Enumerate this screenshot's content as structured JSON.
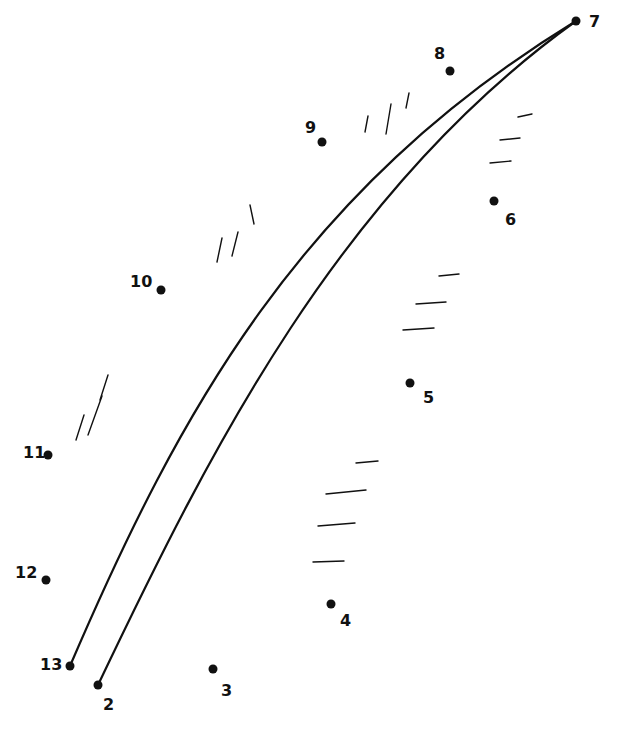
{
  "worksheet": {
    "type": "connect-the-dots",
    "subject": "feather",
    "colors": {
      "ink": "#111111",
      "background": "#ffffff"
    },
    "dots": [
      {
        "n": "2",
        "x": 98,
        "y": 685,
        "lx": 103,
        "ly": 710
      },
      {
        "n": "3",
        "x": 213,
        "y": 669,
        "lx": 221,
        "ly": 696
      },
      {
        "n": "4",
        "x": 331,
        "y": 604,
        "lx": 340,
        "ly": 626
      },
      {
        "n": "5",
        "x": 410,
        "y": 383,
        "lx": 423,
        "ly": 403
      },
      {
        "n": "6",
        "x": 494,
        "y": 201,
        "lx": 505,
        "ly": 225
      },
      {
        "n": "7",
        "x": 576,
        "y": 21,
        "lx": 589,
        "ly": 27
      },
      {
        "n": "8",
        "x": 450,
        "y": 71,
        "lx": 434,
        "ly": 59
      },
      {
        "n": "9",
        "x": 322,
        "y": 142,
        "lx": 305,
        "ly": 133
      },
      {
        "n": "10",
        "x": 161,
        "y": 290,
        "lx": 130,
        "ly": 287
      },
      {
        "n": "11",
        "x": 48,
        "y": 455,
        "lx": 23,
        "ly": 458
      },
      {
        "n": "12",
        "x": 46,
        "y": 580,
        "lx": 15,
        "ly": 578
      },
      {
        "n": "13",
        "x": 70,
        "y": 666,
        "lx": 40,
        "ly": 670
      }
    ],
    "shaft": [
      "M 70 666 C 180 410, 300 190, 576 21",
      "M 98 685 C 210 450, 340 190, 576 21"
    ],
    "hatch_marks": [
      [
        365,
        132,
        368,
        116
      ],
      [
        386,
        134,
        391,
        104
      ],
      [
        406,
        108,
        409,
        93
      ],
      [
        518,
        117,
        532,
        114
      ],
      [
        500,
        140,
        520,
        138
      ],
      [
        490,
        163,
        511,
        161
      ],
      [
        439,
        276,
        459,
        274
      ],
      [
        416,
        304,
        446,
        302
      ],
      [
        403,
        330,
        434,
        328
      ],
      [
        356,
        463,
        378,
        461
      ],
      [
        326,
        494,
        366,
        490
      ],
      [
        318,
        526,
        355,
        523
      ],
      [
        313,
        562,
        344,
        561
      ],
      [
        217,
        262,
        222,
        238
      ],
      [
        232,
        256,
        238,
        232
      ],
      [
        254,
        224,
        250,
        205
      ],
      [
        76,
        440,
        84,
        415
      ],
      [
        88,
        435,
        102,
        396
      ],
      [
        100,
        400,
        108,
        375
      ]
    ]
  }
}
